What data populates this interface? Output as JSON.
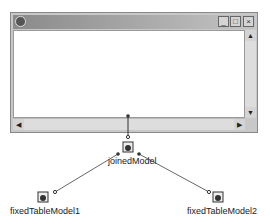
{
  "window": {
    "title": "",
    "buttons": {
      "minimize": "_",
      "maximize": "□",
      "close": "×"
    },
    "scroll": {
      "up": "▲",
      "down": "▼",
      "left": "◀",
      "right": "▶"
    }
  },
  "nodes": [
    {
      "id": "joinedModel",
      "label": "joinedModel"
    },
    {
      "id": "fixedTableModel1",
      "label": "fixedTableModel1"
    },
    {
      "id": "fixedTableModel2",
      "label": "fixedTableModel2"
    }
  ],
  "colors": {
    "line": "#555555",
    "frame": "#c8c8c8",
    "titlebar": "#8a8a8a"
  }
}
